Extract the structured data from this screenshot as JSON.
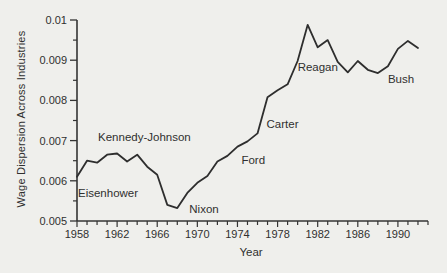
{
  "figure": {
    "background": "#efefec",
    "line_color": "#2e2e2e",
    "axis_color": "#343434",
    "text_color": "#2f2f2f"
  },
  "chart_data": {
    "type": "line",
    "title": "",
    "xlabel": "Year",
    "ylabel": "Wage Dispersion Across Industries",
    "xlim": [
      1958,
      1993
    ],
    "ylim": [
      0.005,
      0.01
    ],
    "grid": false,
    "legend": "none",
    "x": [
      1958,
      1959,
      1960,
      1961,
      1962,
      1963,
      1964,
      1965,
      1966,
      1967,
      1968,
      1969,
      1970,
      1971,
      1972,
      1973,
      1974,
      1975,
      1976,
      1977,
      1978,
      1979,
      1980,
      1981,
      1982,
      1983,
      1984,
      1985,
      1986,
      1987,
      1988,
      1989,
      1990,
      1991,
      1992
    ],
    "values": [
      0.0061,
      0.0065,
      0.00645,
      0.00665,
      0.00668,
      0.00648,
      0.00665,
      0.00635,
      0.00615,
      0.0054,
      0.00532,
      0.0057,
      0.00595,
      0.00612,
      0.00648,
      0.00662,
      0.00685,
      0.00698,
      0.00718,
      0.00808,
      0.00825,
      0.0084,
      0.00898,
      0.00988,
      0.00932,
      0.0095,
      0.00896,
      0.0087,
      0.00898,
      0.00876,
      0.00868,
      0.00885,
      0.00928,
      0.00948,
      0.0093
    ],
    "xticks_major": [
      1958,
      1962,
      1966,
      1970,
      1974,
      1978,
      1982,
      1986,
      1990
    ],
    "xtick_labels": [
      "1958",
      "1962",
      "1966",
      "1970",
      "1974",
      "1978",
      "1982",
      "1986",
      "1990"
    ],
    "xticks_minor_start": 1958,
    "xticks_minor_end": 1993,
    "yticks_major": [
      0.005,
      0.006,
      0.007,
      0.008,
      0.009,
      0.01
    ],
    "ytick_labels": [
      "0.005",
      "0.006",
      "0.007",
      "0.008",
      "0.009",
      "0.01"
    ],
    "yticks_minor": [
      0.0055,
      0.0065,
      0.0075,
      0.0085,
      0.0095
    ],
    "annotations": [
      {
        "label": "Eisenhower",
        "year": 1958.1,
        "value": 0.0057
      },
      {
        "label": "Kennedy-Johnson",
        "year": 1960.1,
        "value": 0.0071
      },
      {
        "label": "Nixon",
        "year": 1969.2,
        "value": 0.0053
      },
      {
        "label": "Ford",
        "year": 1974.4,
        "value": 0.00652
      },
      {
        "label": "Carter",
        "year": 1976.9,
        "value": 0.00742
      },
      {
        "label": "Reagan",
        "year": 1980.0,
        "value": 0.00883
      },
      {
        "label": "Bush",
        "year": 1989.0,
        "value": 0.00853
      }
    ]
  }
}
